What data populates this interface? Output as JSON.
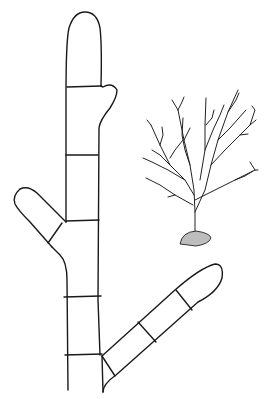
{
  "figure": {
    "type": "botanical line illustration",
    "colors": {
      "ink": "#1a1a1a",
      "background": "#ffffff"
    },
    "filament": {
      "cross_walls": 9,
      "branches": [
        "left-upper-branch",
        "right-lower-branch",
        "small-right-bud"
      ]
    },
    "inset_plant": {
      "description": "bushy dichotomously branched thallus on stone holdfast"
    }
  }
}
